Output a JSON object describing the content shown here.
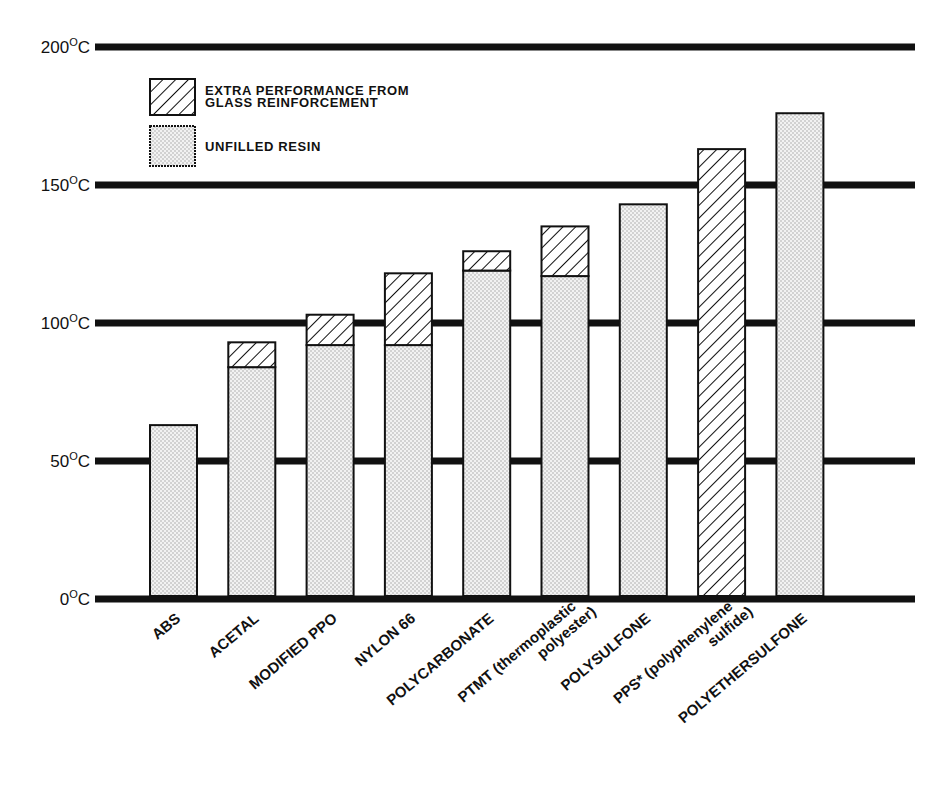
{
  "chart_data": {
    "type": "bar",
    "stacked": true,
    "title": "",
    "xlabel": "",
    "ylabel": "",
    "ylim": [
      0,
      200
    ],
    "yticks": [
      0,
      50,
      100,
      150,
      200
    ],
    "ytick_labels": [
      "0°C",
      "50°C",
      "100°C",
      "150°C",
      "200°C"
    ],
    "grid": true,
    "legend_position": "upper-left",
    "categories": [
      "ABS",
      "ACETAL",
      "MODIFIED PPO",
      "NYLON 66",
      "POLYCARBONATE",
      "PTMT (thermoplastic polyester)",
      "POLYSULFONE",
      "PPS* (polyphenylene sulfide)",
      "POLYETHERSULFONE"
    ],
    "series": [
      {
        "name": "UNFILLED RESIN",
        "pattern": "dots",
        "values": [
          63,
          84,
          92,
          92,
          119,
          117,
          143,
          0,
          176
        ]
      },
      {
        "name": "EXTRA PERFORMANCE FROM GLASS REINFORCEMENT",
        "pattern": "hatch",
        "values": [
          0,
          9,
          11,
          26,
          7,
          18,
          0,
          163,
          0
        ]
      }
    ],
    "totals": [
      63,
      93,
      103,
      118,
      126,
      135,
      143,
      163,
      176
    ]
  },
  "legend": {
    "items": [
      {
        "label_lines": [
          "EXTRA PERFORMANCE FROM",
          "GLASS REINFORCEMENT"
        ],
        "pattern": "hatch"
      },
      {
        "label_lines": [
          "UNFILLED RESIN"
        ],
        "pattern": "dots"
      }
    ]
  },
  "x_labels": [
    {
      "lines": [
        "ABS"
      ]
    },
    {
      "lines": [
        "ACETAL"
      ]
    },
    {
      "lines": [
        "MODIFIED PPO"
      ]
    },
    {
      "lines": [
        "NYLON 66"
      ]
    },
    {
      "lines": [
        "POLYCARBONATE"
      ]
    },
    {
      "lines": [
        "PTMT (thermoplastic",
        "polyester)"
      ]
    },
    {
      "lines": [
        "POLYSULFONE"
      ]
    },
    {
      "lines": [
        "PPS* (polyphenylene",
        "sulfide)"
      ]
    },
    {
      "lines": [
        "POLYETHERSULFONE"
      ]
    }
  ],
  "colors": {
    "ink": "#111111",
    "dot_fill": "#e6e6e6",
    "background": "#ffffff"
  }
}
